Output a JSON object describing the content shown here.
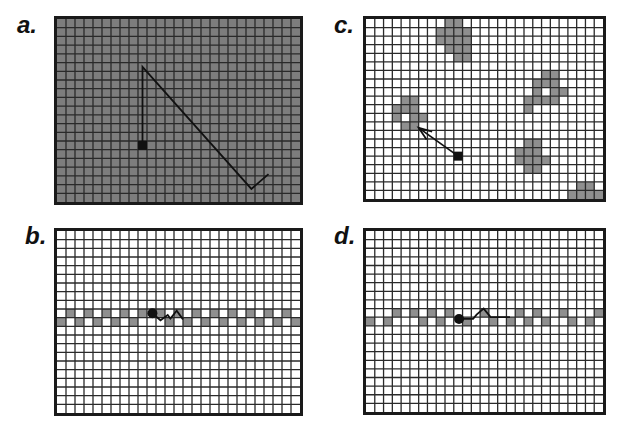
{
  "colors": {
    "frame": "#1a1a1a",
    "grid": "#2a2a2a",
    "dark_fill": "#7d7d7d",
    "patch_fill": "#8f8f8f",
    "white": "#ffffff",
    "path": "#111111"
  },
  "grid": {
    "cols": 27,
    "rows": 21
  },
  "panels": [
    {
      "id": "a",
      "label": "a.",
      "background": "dark",
      "patches": [],
      "start": {
        "col": 9.5,
        "row": 14.5,
        "marker": "square"
      },
      "path": [
        [
          9.5,
          14.5
        ],
        [
          9.5,
          5.5
        ],
        [
          21.6,
          19.5
        ],
        [
          23.5,
          17.8
        ]
      ],
      "arrow": false
    },
    {
      "id": "b",
      "label": "b.",
      "background": "white",
      "patch_rows": [
        {
          "row": 9,
          "cols": [
            1,
            3,
            5,
            7,
            9,
            13,
            15,
            17,
            19,
            21,
            23,
            25
          ]
        },
        {
          "row": 10,
          "cols": [
            0,
            2,
            4,
            6,
            8,
            14,
            16,
            18,
            20,
            22,
            24,
            26
          ]
        }
      ],
      "patches": [
        [
          11,
          9
        ],
        [
          12,
          10
        ]
      ],
      "start": {
        "col": 10.6,
        "row": 9.5,
        "marker": "circle"
      },
      "path": [
        [
          10.6,
          9.5
        ],
        [
          11.5,
          10.3
        ],
        [
          12.3,
          9.7
        ],
        [
          12.6,
          10.1
        ],
        [
          13.3,
          9.2
        ],
        [
          14,
          10.2
        ]
      ],
      "arrow": false
    },
    {
      "id": "c",
      "label": "c.",
      "background": "white",
      "patches": [
        [
          9,
          0
        ],
        [
          10,
          0
        ],
        [
          8,
          1
        ],
        [
          9,
          1
        ],
        [
          10,
          1
        ],
        [
          11,
          1
        ],
        [
          8,
          2
        ],
        [
          9,
          2
        ],
        [
          10,
          2
        ],
        [
          11,
          2
        ],
        [
          9,
          3
        ],
        [
          10,
          3
        ],
        [
          11,
          3
        ],
        [
          10,
          4
        ],
        [
          11,
          4
        ],
        [
          4,
          9
        ],
        [
          5,
          9
        ],
        [
          3,
          10
        ],
        [
          4,
          10
        ],
        [
          5,
          10
        ],
        [
          3,
          11
        ],
        [
          5,
          11
        ],
        [
          6,
          11
        ],
        [
          4,
          12
        ],
        [
          5,
          12
        ],
        [
          20,
          6
        ],
        [
          21,
          6
        ],
        [
          19,
          7
        ],
        [
          20,
          7
        ],
        [
          21,
          7
        ],
        [
          19,
          8
        ],
        [
          21,
          8
        ],
        [
          22,
          8
        ],
        [
          18,
          9
        ],
        [
          19,
          9
        ],
        [
          20,
          9
        ],
        [
          21,
          9
        ],
        [
          18,
          10
        ],
        [
          18,
          14
        ],
        [
          19,
          14
        ],
        [
          17,
          15
        ],
        [
          18,
          15
        ],
        [
          19,
          15
        ],
        [
          17,
          16
        ],
        [
          18,
          16
        ],
        [
          19,
          16
        ],
        [
          20,
          16
        ],
        [
          18,
          17
        ],
        [
          19,
          17
        ],
        [
          24,
          19
        ],
        [
          25,
          19
        ],
        [
          23,
          20
        ],
        [
          24,
          20
        ],
        [
          25,
          20
        ],
        [
          26,
          20
        ]
      ],
      "start": {
        "col": 10.5,
        "row": 16.0,
        "marker": "square"
      },
      "path": [
        [
          10.5,
          16.0
        ],
        [
          6.0,
          12.7
        ]
      ],
      "arrow": true
    },
    {
      "id": "d",
      "label": "d.",
      "background": "white",
      "patch_rows": [
        {
          "row": 9,
          "cols": [
            3,
            5,
            7,
            9,
            13,
            17,
            19,
            22,
            26
          ]
        },
        {
          "row": 10,
          "cols": [
            0,
            2,
            6,
            8,
            11,
            14,
            16,
            18,
            20,
            23,
            25
          ]
        }
      ],
      "patches": [],
      "start": {
        "col": 10.6,
        "row": 10.2,
        "marker": "circle"
      },
      "path": [
        [
          10.6,
          10.2
        ],
        [
          12.2,
          10.2
        ],
        [
          12.6,
          9.7
        ],
        [
          13.4,
          9.0
        ],
        [
          14.2,
          10.0
        ],
        [
          16.4,
          10.0
        ]
      ],
      "arrow": false
    }
  ]
}
